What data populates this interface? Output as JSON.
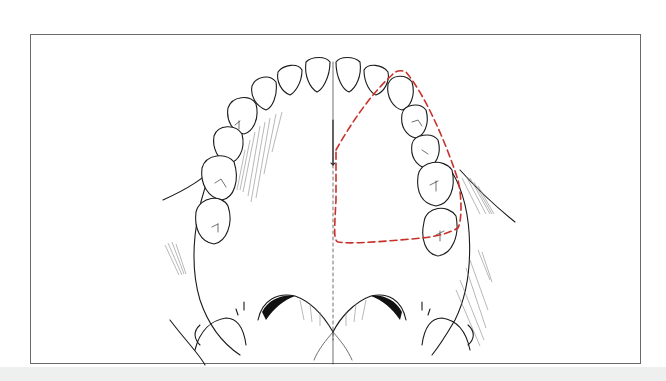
{
  "figure": {
    "outline_color": "#c8302a",
    "frame_color": "#6a6a6a",
    "band_color": "#eef0ef"
  }
}
